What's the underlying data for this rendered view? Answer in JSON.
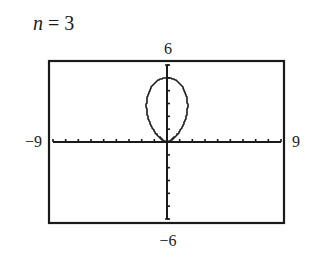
{
  "chart_data": {
    "type": "line",
    "title": {
      "variable": "n",
      "equals": " = ",
      "value": "3"
    },
    "equation": {
      "form": "polar",
      "amplitude": 5,
      "n": 3,
      "theta_range": [
        0,
        6.283185307
      ]
    },
    "window": {
      "xmin": -9,
      "xmax": 9,
      "ymin": -6,
      "ymax": 6,
      "xscl": 1,
      "yscl": 1
    },
    "tick_labels": {
      "xmin": "−9",
      "xmax": "9",
      "ymin": "−6",
      "ymax": "6"
    },
    "grid": false,
    "legend": null,
    "xlabel": "",
    "ylabel": ""
  }
}
